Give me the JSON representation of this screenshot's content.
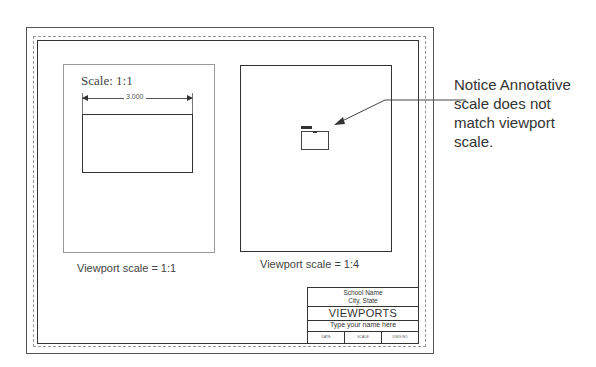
{
  "left_viewport": {
    "scale_label": "Scale: 1:1",
    "dimension_value": "3.000",
    "caption": "Viewport scale = 1:1"
  },
  "right_viewport": {
    "caption": "Viewport scale = 1:4"
  },
  "callout": {
    "text": "Notice Annotative scale does not match viewport scale."
  },
  "title_block": {
    "school": "School Name",
    "city": "City, State",
    "title": "VIEWPORTS",
    "name_placeholder": "Type your name here",
    "cells": [
      "DATE",
      "SCALE",
      "DWG NO"
    ]
  },
  "colors": {
    "line": "#333333",
    "light_line": "#999999",
    "background": "#ffffff"
  }
}
